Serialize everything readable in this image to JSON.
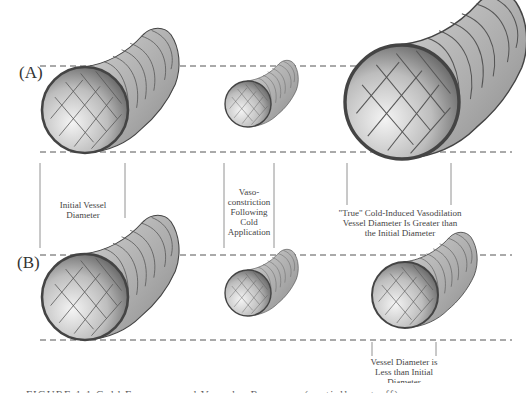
{
  "figure": {
    "panels": [
      {
        "id": "A",
        "label": "(A)"
      },
      {
        "id": "B",
        "label": "(B)"
      }
    ],
    "annotations": {
      "initial": "Initial Vessel\nDiameter",
      "initial_lines": [
        "Initial Vessel",
        "Diameter"
      ],
      "vasoconstriction_lines": [
        "Vaso-",
        "constriction",
        "Following",
        "Cold",
        "Application"
      ],
      "true_cidv_lines": [
        "\"True\" Cold-Induced Vasodilation",
        "Vessel Diameter Is Greater than",
        "the Initial Diameter"
      ],
      "less_than_lines": [
        "Vessel Diameter is",
        "Less than Initial",
        "Diameter"
      ]
    },
    "caption": "FIGURE 1.1  Cold Exposure and Vascular Response (partially cut off)",
    "colors": {
      "line": "#555555",
      "vessel_outer": "#b5b5b5",
      "vessel_inner_light": "#f2f2f2",
      "vessel_inner_dark": "#6e6e6e",
      "rim": "#4a4a4a"
    },
    "vessels": [
      {
        "panel": "A",
        "name": "initial",
        "cx": 85,
        "cy": 110,
        "r": 43
      },
      {
        "panel": "A",
        "name": "vasoconstricted",
        "cx": 248,
        "cy": 104,
        "r": 23
      },
      {
        "panel": "A",
        "name": "true-vasodilation",
        "cx": 402,
        "cy": 102,
        "r": 57
      },
      {
        "panel": "B",
        "name": "initial",
        "cx": 85,
        "cy": 297,
        "r": 43
      },
      {
        "panel": "B",
        "name": "vasoconstricted",
        "cx": 248,
        "cy": 293,
        "r": 23
      },
      {
        "panel": "B",
        "name": "partial-dilation",
        "cx": 405,
        "cy": 295,
        "r": 33
      }
    ]
  }
}
